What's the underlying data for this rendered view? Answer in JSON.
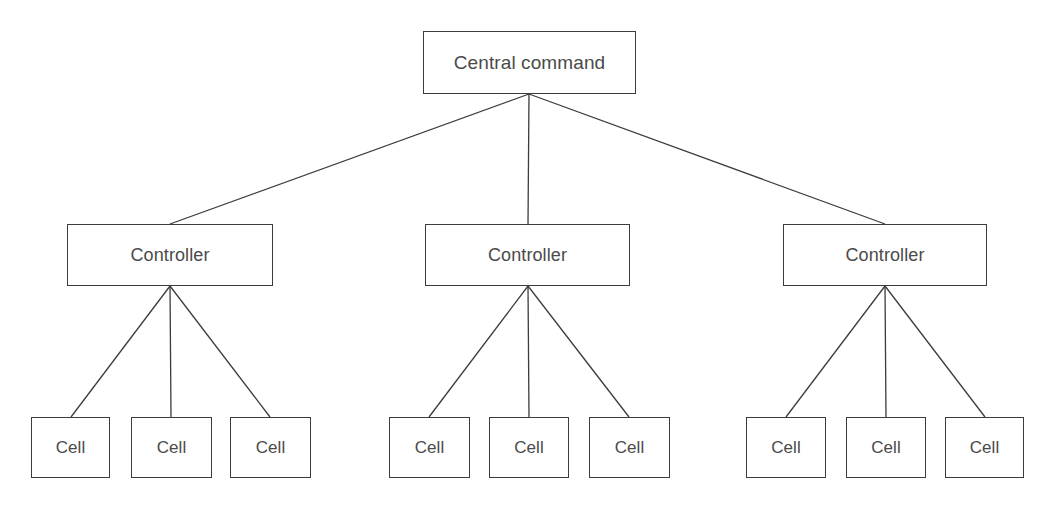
{
  "diagram": {
    "type": "hierarchy-tree",
    "background_color": "#ffffff",
    "stroke_color": "#3c3c3c",
    "text_color": "#4a4a4a",
    "levels": 3,
    "root": {
      "label": "Central command",
      "x": 423,
      "y": 31,
      "w": 213,
      "h": 63
    },
    "controllers": [
      {
        "label": "Controller",
        "x": 67,
        "y": 224,
        "w": 206,
        "h": 62
      },
      {
        "label": "Controller",
        "x": 425,
        "y": 224,
        "w": 205,
        "h": 62
      },
      {
        "label": "Controller",
        "x": 783,
        "y": 224,
        "w": 204,
        "h": 62
      }
    ],
    "cells": [
      {
        "label": "Cell",
        "x": 31,
        "y": 417,
        "w": 79,
        "h": 61,
        "parent": 0
      },
      {
        "label": "Cell",
        "x": 131,
        "y": 417,
        "w": 81,
        "h": 61,
        "parent": 0
      },
      {
        "label": "Cell",
        "x": 230,
        "y": 417,
        "w": 81,
        "h": 61,
        "parent": 0
      },
      {
        "label": "Cell",
        "x": 389,
        "y": 417,
        "w": 81,
        "h": 61,
        "parent": 1
      },
      {
        "label": "Cell",
        "x": 489,
        "y": 417,
        "w": 80,
        "h": 61,
        "parent": 1
      },
      {
        "label": "Cell",
        "x": 589,
        "y": 417,
        "w": 81,
        "h": 61,
        "parent": 1
      },
      {
        "label": "Cell",
        "x": 746,
        "y": 417,
        "w": 80,
        "h": 61,
        "parent": 2
      },
      {
        "label": "Cell",
        "x": 846,
        "y": 417,
        "w": 80,
        "h": 61,
        "parent": 2
      },
      {
        "label": "Cell",
        "x": 945,
        "y": 417,
        "w": 79,
        "h": 61,
        "parent": 2
      }
    ],
    "connectors": [
      {
        "name": "root-to-controller-1",
        "x1": 529,
        "y1": 94,
        "x2": 170,
        "y2": 224
      },
      {
        "name": "root-to-controller-2",
        "x1": 529,
        "y1": 94,
        "x2": 528,
        "y2": 224
      },
      {
        "name": "root-to-controller-3",
        "x1": 529,
        "y1": 94,
        "x2": 885,
        "y2": 224
      },
      {
        "name": "controller-1-to-cell-1",
        "x1": 170,
        "y1": 286,
        "x2": 71,
        "y2": 417
      },
      {
        "name": "controller-1-to-cell-2",
        "x1": 170,
        "y1": 286,
        "x2": 171,
        "y2": 417
      },
      {
        "name": "controller-1-to-cell-3",
        "x1": 170,
        "y1": 286,
        "x2": 270,
        "y2": 417
      },
      {
        "name": "controller-2-to-cell-1",
        "x1": 528,
        "y1": 286,
        "x2": 429,
        "y2": 417
      },
      {
        "name": "controller-2-to-cell-2",
        "x1": 528,
        "y1": 286,
        "x2": 529,
        "y2": 417
      },
      {
        "name": "controller-2-to-cell-3",
        "x1": 528,
        "y1": 286,
        "x2": 629,
        "y2": 417
      },
      {
        "name": "controller-3-to-cell-1",
        "x1": 885,
        "y1": 286,
        "x2": 786,
        "y2": 417
      },
      {
        "name": "controller-3-to-cell-2",
        "x1": 885,
        "y1": 286,
        "x2": 886,
        "y2": 417
      },
      {
        "name": "controller-3-to-cell-3",
        "x1": 885,
        "y1": 286,
        "x2": 985,
        "y2": 417
      }
    ]
  }
}
